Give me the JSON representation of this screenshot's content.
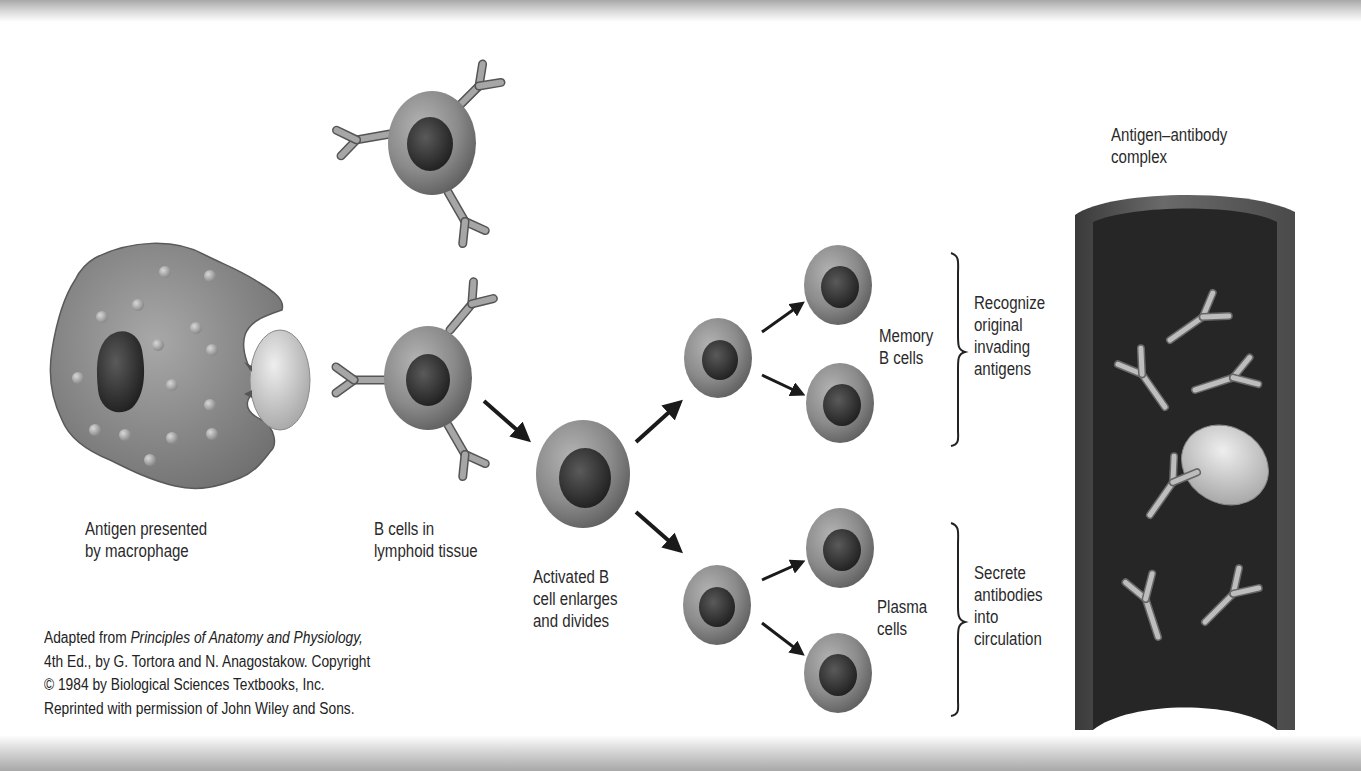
{
  "figure": {
    "stages": [
      {
        "id": "macrophage",
        "label_lines": [
          "Antigen presented",
          "by macrophage"
        ]
      },
      {
        "id": "b_cells",
        "label_lines": [
          "B cells in",
          "lymphoid tissue"
        ]
      },
      {
        "id": "activated",
        "label_lines": [
          "Activated B",
          "cell enlarges",
          "and divides"
        ]
      },
      {
        "id": "memory",
        "label_lines": [
          "Memory",
          "B cells"
        ],
        "role_lines": [
          "Recognize",
          "original",
          "invading",
          "antigens"
        ]
      },
      {
        "id": "plasma",
        "label_lines": [
          "Plasma",
          "cells"
        ],
        "role_lines": [
          "Secrete",
          "antibodies",
          "into",
          "circulation"
        ]
      },
      {
        "id": "complex",
        "label_lines": [
          "Antigen–antibody",
          "complex"
        ]
      }
    ],
    "credit": {
      "prefix": "Adapted from ",
      "book_title": "Principles of Anatomy and Physiology,",
      "line2": "4th Ed., by G. Tortora and N. Anagostakow. Copyright",
      "line3": "© 1984 by Biological Sciences Textbooks, Inc.",
      "line4": "Reprinted with permission of John Wiley and Sons."
    },
    "colors": {
      "cell_body": "#8a8a8a",
      "nucleus": "#3a3a3a",
      "antibody": "#9c9c9c",
      "vessel_wall": "#5a5a5a",
      "vessel_lumen": "#262626",
      "antigen": "#d8d8d8",
      "text": "#2a2a2a"
    }
  }
}
